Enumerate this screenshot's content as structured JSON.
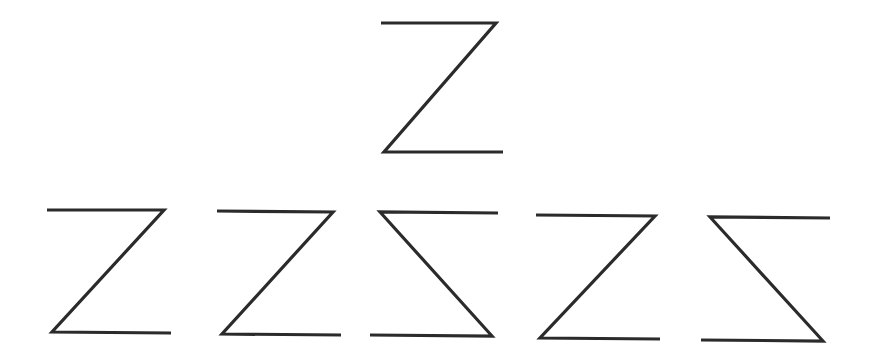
{
  "puzzle": {
    "type": "mental-rotation",
    "stroke_color": "#2b2b2b",
    "background": "#ffffff",
    "target": {
      "label": "Z",
      "glyph": "Z-shape",
      "points": "381,23 496,23 384,152 503,152"
    },
    "options": [
      {
        "index": 1,
        "glyph": "Z-shape",
        "points": "47,210 164,210 52,332 171,333"
      },
      {
        "index": 2,
        "glyph": "Z-shape",
        "points": "217,211 333,212 222,334 341,335"
      },
      {
        "index": 3,
        "glyph": "mirrored-Z-shape",
        "points": "498,213 380,212 492,336 370,335"
      },
      {
        "index": 4,
        "glyph": "Z-shape",
        "points": "536,215 655,216 540,338 660,339"
      },
      {
        "index": 5,
        "glyph": "mirrored-Z-shape",
        "points": "830,218 710,217 823,341 701,340"
      }
    ]
  }
}
